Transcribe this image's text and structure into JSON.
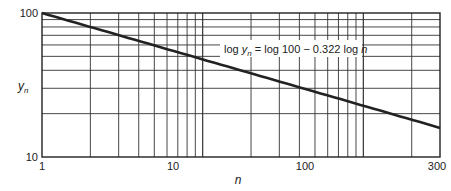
{
  "chart_data": {
    "type": "line",
    "title": "",
    "xlabel": "n",
    "ylabel": "y_n",
    "xscale": "log",
    "yscale": "log",
    "xlim": [
      1,
      300
    ],
    "ylim": [
      10,
      100
    ],
    "grid": true,
    "x_tick_labels": [
      "1",
      "10",
      "100",
      "300"
    ],
    "y_tick_labels": [
      "10",
      "100"
    ],
    "annotation": "log y_n = log 100 − 0.322 log n",
    "series": [
      {
        "name": "y_n = 100 n^-0.322",
        "x": [
          1,
          2,
          5,
          10,
          20,
          50,
          100,
          200,
          300
        ],
        "y": [
          100,
          80,
          59.6,
          47.6,
          38.1,
          28.4,
          22.7,
          18.2,
          15.9
        ]
      }
    ]
  },
  "labels": {
    "y100": "100",
    "y10": "10",
    "x1": "1",
    "x10": "10",
    "x100": "100",
    "x300": "300",
    "xlabel": "n",
    "ylabel_main": "y",
    "ylabel_sub": "n",
    "eq_part1": "log ",
    "eq_y": "y",
    "eq_sub": "n",
    "eq_part2": " = log 100 − 0.322 log ",
    "eq_n": "n"
  }
}
